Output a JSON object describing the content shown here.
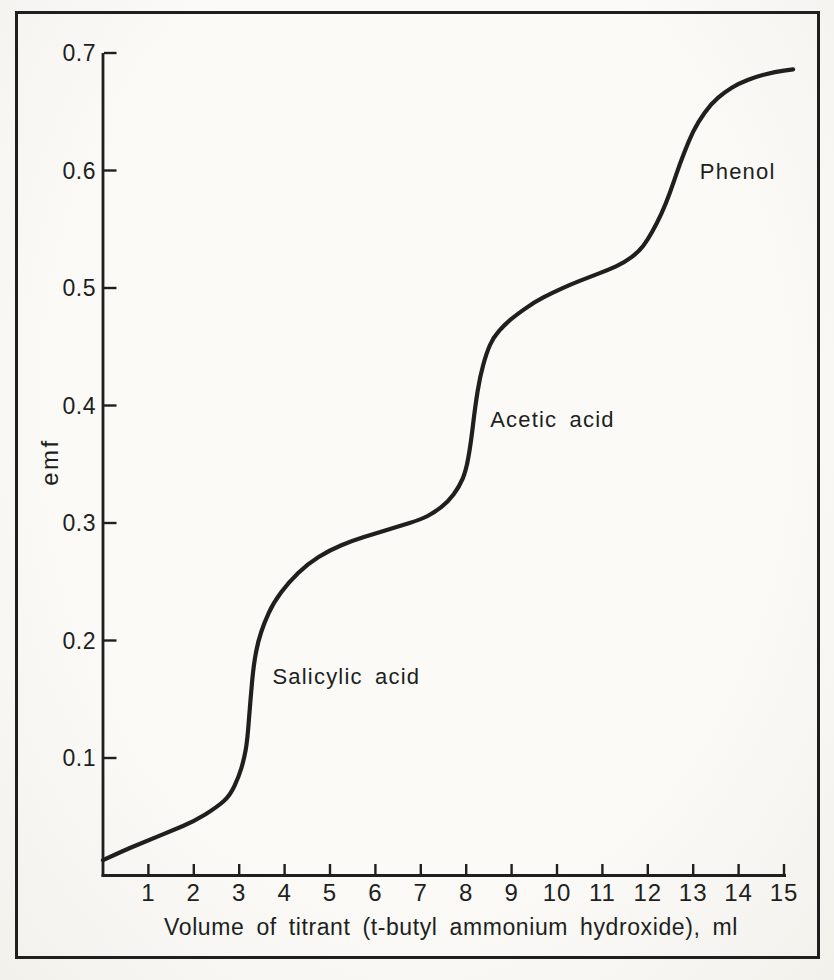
{
  "style": {
    "ink": "#201f1d",
    "paper": "#fbfaf7",
    "curve_width": 4.2,
    "axis_width": 2.8,
    "tick_width": 2.4
  },
  "chart_data": {
    "type": "line",
    "title": "",
    "xlabel": "Volume of titrant (t-butyl ammonium hydroxide), ml",
    "ylabel": "emf",
    "xlim": [
      0,
      15.3
    ],
    "ylim": [
      0,
      0.7
    ],
    "grid": false,
    "legend": null,
    "x_tick_values": [
      1,
      2,
      3,
      4,
      5,
      6,
      7,
      8,
      9,
      10,
      11,
      12,
      13,
      14,
      15
    ],
    "x_tick_labels": [
      "1",
      "2",
      "3",
      "4",
      "5",
      "6",
      "7",
      "8",
      "9",
      "10",
      "11",
      "12",
      "13",
      "14",
      "15"
    ],
    "y_tick_values": [
      0.1,
      0.2,
      0.3,
      0.4,
      0.5,
      0.6,
      0.7
    ],
    "y_tick_labels": [
      "0.1",
      "0.2",
      "0.3",
      "0.4",
      "0.5",
      "0.6",
      "0.7"
    ],
    "series": [
      {
        "name": "titration curve",
        "points": [
          [
            0,
            0.013
          ],
          [
            0.5,
            0.022
          ],
          [
            1,
            0.03
          ],
          [
            1.5,
            0.038
          ],
          [
            2,
            0.046
          ],
          [
            2.5,
            0.058
          ],
          [
            2.8,
            0.068
          ],
          [
            3.0,
            0.085
          ],
          [
            3.1,
            0.098
          ],
          [
            3.18,
            0.115
          ],
          [
            3.25,
            0.15
          ],
          [
            3.32,
            0.18
          ],
          [
            3.42,
            0.2
          ],
          [
            3.55,
            0.215
          ],
          [
            3.75,
            0.232
          ],
          [
            4.1,
            0.25
          ],
          [
            4.5,
            0.265
          ],
          [
            5.0,
            0.277
          ],
          [
            5.5,
            0.285
          ],
          [
            6.0,
            0.291
          ],
          [
            6.5,
            0.297
          ],
          [
            7.0,
            0.303
          ],
          [
            7.3,
            0.309
          ],
          [
            7.6,
            0.318
          ],
          [
            7.85,
            0.331
          ],
          [
            8.0,
            0.345
          ],
          [
            8.1,
            0.367
          ],
          [
            8.2,
            0.4
          ],
          [
            8.3,
            0.424
          ],
          [
            8.45,
            0.445
          ],
          [
            8.6,
            0.458
          ],
          [
            8.85,
            0.469
          ],
          [
            9.1,
            0.477
          ],
          [
            9.5,
            0.488
          ],
          [
            9.9,
            0.496
          ],
          [
            10.3,
            0.503
          ],
          [
            10.7,
            0.509
          ],
          [
            11.1,
            0.515
          ],
          [
            11.5,
            0.522
          ],
          [
            11.8,
            0.531
          ],
          [
            12.0,
            0.541
          ],
          [
            12.2,
            0.555
          ],
          [
            12.4,
            0.572
          ],
          [
            12.55,
            0.588
          ],
          [
            12.7,
            0.605
          ],
          [
            12.9,
            0.625
          ],
          [
            13.1,
            0.641
          ],
          [
            13.4,
            0.657
          ],
          [
            13.7,
            0.667
          ],
          [
            14.0,
            0.674
          ],
          [
            14.4,
            0.68
          ],
          [
            14.8,
            0.684
          ],
          [
            15.2,
            0.686
          ]
        ]
      }
    ],
    "annotations": [
      {
        "label": "Salicylic acid",
        "x": 5.36,
        "y": 0.169
      },
      {
        "label": "Acetic acid",
        "x": 9.9,
        "y": 0.388
      },
      {
        "label": "Phenol",
        "x": 13.98,
        "y": 0.599
      }
    ]
  }
}
